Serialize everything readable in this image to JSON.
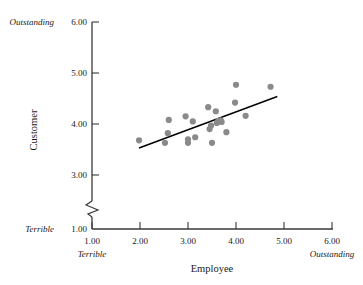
{
  "chart_data": {
    "type": "scatter",
    "title": "",
    "xlabel": "Employee",
    "ylabel": "Customer",
    "xlim": [
      1.0,
      6.0
    ],
    "ylim": [
      1.0,
      6.0
    ],
    "y_axis_break": {
      "between": [
        1.0,
        3.0
      ],
      "symbol": "zigzag"
    },
    "grid": false,
    "legend": null,
    "x_ticks": [
      "1.00",
      "2.00",
      "3.00",
      "4.00",
      "5.00",
      "6.00"
    ],
    "x_tick_values": [
      1.0,
      2.0,
      3.0,
      4.0,
      5.0,
      6.0
    ],
    "y_ticks": [
      "1.00",
      "3.00",
      "4.00",
      "5.00",
      "6.00"
    ],
    "y_tick_values": [
      1.0,
      3.0,
      4.0,
      5.0,
      6.0
    ],
    "x_anchor_low": "Terrible",
    "x_anchor_high": "Outstanding",
    "y_anchor_low": "Terrible",
    "y_anchor_high": "Outstanding",
    "point_color": "#8a8a8a",
    "line_color": "#000000",
    "points": [
      {
        "x": 1.98,
        "y": 3.68
      },
      {
        "x": 2.52,
        "y": 3.63
      },
      {
        "x": 2.58,
        "y": 3.82
      },
      {
        "x": 2.6,
        "y": 4.08
      },
      {
        "x": 2.95,
        "y": 4.15
      },
      {
        "x": 3.0,
        "y": 3.7
      },
      {
        "x": 3.0,
        "y": 3.63
      },
      {
        "x": 3.1,
        "y": 4.05
      },
      {
        "x": 3.15,
        "y": 3.74
      },
      {
        "x": 3.42,
        "y": 4.33
      },
      {
        "x": 3.45,
        "y": 3.9
      },
      {
        "x": 3.48,
        "y": 3.97
      },
      {
        "x": 3.5,
        "y": 3.63
      },
      {
        "x": 3.58,
        "y": 4.25
      },
      {
        "x": 3.6,
        "y": 4.02
      },
      {
        "x": 3.63,
        "y": 4.06
      },
      {
        "x": 3.68,
        "y": 4.07
      },
      {
        "x": 3.7,
        "y": 4.04
      },
      {
        "x": 3.8,
        "y": 3.84
      },
      {
        "x": 3.98,
        "y": 4.42
      },
      {
        "x": 4.0,
        "y": 4.77
      },
      {
        "x": 4.2,
        "y": 4.16
      },
      {
        "x": 4.72,
        "y": 4.73
      }
    ],
    "trendline": {
      "x1": 1.98,
      "y1": 3.53,
      "x2": 4.86,
      "y2": 4.54
    }
  },
  "axes": {
    "y_title": "Customer",
    "x_title": "Employee"
  }
}
